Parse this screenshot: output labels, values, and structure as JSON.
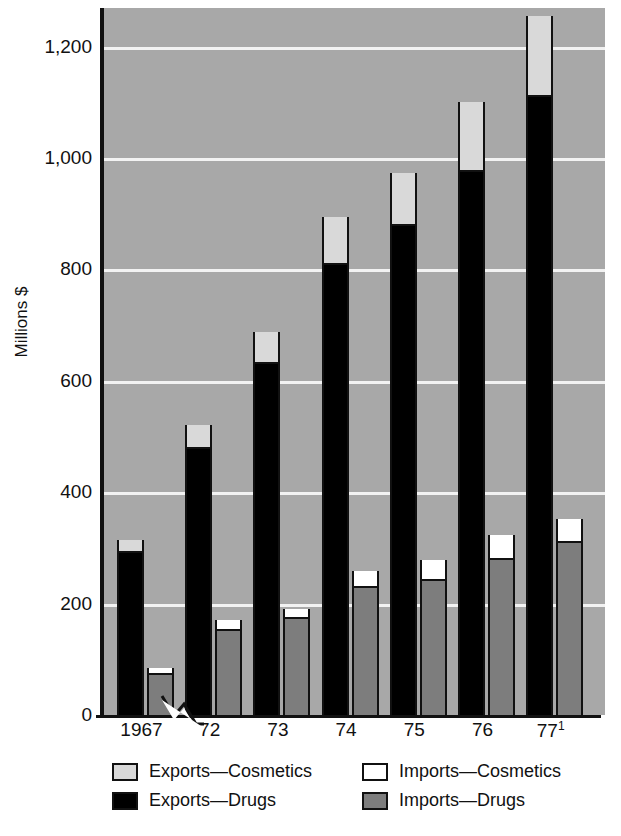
{
  "chart_data": {
    "type": "bar",
    "title": "",
    "xlabel": "",
    "ylabel": "Millions $",
    "ylim": [
      0,
      1300
    ],
    "yticks": [
      0,
      200,
      400,
      600,
      800,
      1000,
      1200
    ],
    "ytick_labels": [
      "0",
      "200",
      "400",
      "600",
      "800",
      "1,000",
      "1,200"
    ],
    "grid": true,
    "grid_axis": "y",
    "legend_position": "bottom",
    "stacked": true,
    "grouped": true,
    "axis_break_after_first_category": true,
    "categories": [
      "1967",
      "72",
      "73",
      "74",
      "75",
      "76",
      "77"
    ],
    "category_labels": [
      "1967",
      "72",
      "73",
      "74",
      "75",
      "76",
      "77"
    ],
    "category_footnote_marks": [
      "",
      "",
      "",
      "",
      "",
      "",
      "1"
    ],
    "groups": [
      {
        "name": "Exports",
        "series": [
          {
            "name": "Exports—Drugs",
            "color": "#000000",
            "values": [
              290,
              478,
              630,
              808,
              878,
              975,
              1110
            ]
          },
          {
            "name": "Exports—Cosmetics",
            "color": "#d9d9d9",
            "values": [
              25,
              42,
              58,
              87,
              95,
              125,
              145
            ]
          }
        ],
        "totals": [
          315,
          520,
          688,
          895,
          973,
          1100,
          1255
        ]
      },
      {
        "name": "Imports",
        "series": [
          {
            "name": "Imports—Drugs",
            "color": "#7d7d7d",
            "values": [
              72,
              150,
              172,
              228,
              240,
              278,
              308
            ]
          },
          {
            "name": "Imports—Cosmetics",
            "color": "#ffffff",
            "values": [
              13,
              20,
              18,
              30,
              38,
              45,
              44
            ]
          }
        ],
        "totals": [
          85,
          170,
          190,
          258,
          278,
          323,
          352
        ]
      }
    ]
  },
  "axis": {
    "y_title": "Millions $",
    "ticks": [
      {
        "label": "1,200",
        "value": 1200
      },
      {
        "label": "1,000",
        "value": 1000
      },
      {
        "label": "800",
        "value": 800
      },
      {
        "label": "600",
        "value": 600
      },
      {
        "label": "400",
        "value": 400
      },
      {
        "label": "200",
        "value": 200
      },
      {
        "label": "0",
        "value": 0
      }
    ]
  },
  "xaxis": {
    "labels": [
      {
        "text": "1967",
        "sup": ""
      },
      {
        "text": "72",
        "sup": ""
      },
      {
        "text": "73",
        "sup": ""
      },
      {
        "text": "74",
        "sup": ""
      },
      {
        "text": "75",
        "sup": ""
      },
      {
        "text": "76",
        "sup": ""
      },
      {
        "text": "77",
        "sup": "1"
      }
    ]
  },
  "legend": {
    "left_column": [
      {
        "label": "Exports—Cosmetics",
        "swatch": "exp-cos"
      },
      {
        "label": "Exports—Drugs",
        "swatch": "exp-drug"
      }
    ],
    "right_column": [
      {
        "label": "Imports—Cosmetics",
        "swatch": "imp-cos"
      },
      {
        "label": "Imports—Drugs",
        "swatch": "imp-drug"
      }
    ]
  },
  "colors": {
    "plot_background": "#a8a8a8",
    "gridline": "#f2f2f2",
    "axis": "#111111",
    "exports_drugs": "#000000",
    "exports_cosmetics": "#d9d9d9",
    "imports_drugs": "#7d7d7d",
    "imports_cosmetics": "#ffffff"
  }
}
